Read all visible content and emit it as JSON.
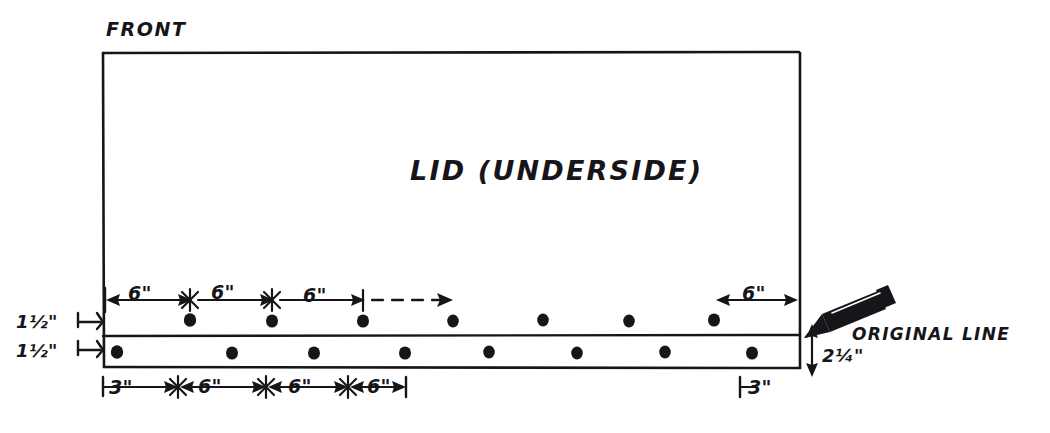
{
  "sheet": {
    "background_color": "#ffffff",
    "ink_color": "#16161a"
  },
  "labels": {
    "front": "FRONT",
    "title": "LID (UNDERSIDE)",
    "original_line": "ORIGINAL LINE"
  },
  "vertical_dimensions": {
    "upper_band": "1½\"",
    "lower_band": "1½\"",
    "right_offset": "2¼\""
  },
  "upper_row": {
    "segments": [
      "6\"",
      "6\"",
      "6\"",
      "6\""
    ],
    "continuation": "dashed-arrow",
    "dot_count": 8
  },
  "lower_row": {
    "end_margin_left": "3\"",
    "segments": [
      "6\"",
      "6\"",
      "6\""
    ],
    "end_margin_right": "3\"",
    "dot_count": 8
  },
  "icons": {
    "pencil": "pencil-icon"
  },
  "geometry": {
    "box": {
      "left": 103,
      "top": 52,
      "right": 800,
      "bottom": 368
    },
    "band_divider_y": 336,
    "upper_dot_y": 320,
    "lower_dot_y": 352,
    "upper_dots_x": [
      190,
      272,
      363,
      453,
      543,
      629,
      714,
      800
    ],
    "lower_dots_x": [
      117,
      232,
      314,
      405,
      489,
      577,
      665,
      752
    ],
    "upper_dim_y": 299,
    "lower_dim_y": 386
  }
}
